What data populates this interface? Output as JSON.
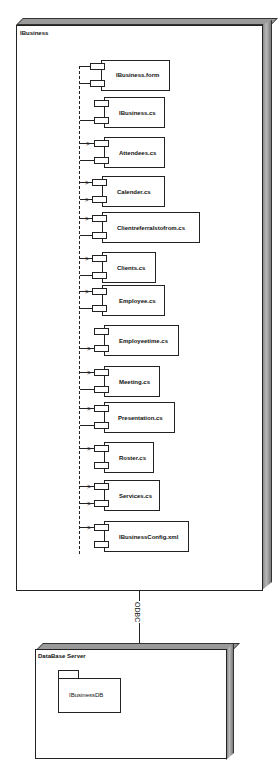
{
  "diagram": {
    "type": "UML deployment diagram",
    "nodes": [
      {
        "name": "IBusiness",
        "components": [
          {
            "label": "IBusiness.form"
          },
          {
            "label": "IBusiness.cs"
          },
          {
            "label": "Attendees.cs"
          },
          {
            "label": "Calender.cs"
          },
          {
            "label": "Clientreferralstofrom.cs"
          },
          {
            "label": "Clients.cs"
          },
          {
            "label": "Employee.cs"
          },
          {
            "label": "Employeetime.cs"
          },
          {
            "label": "Meeting.cs"
          },
          {
            "label": "Presentation.cs"
          },
          {
            "label": "Roster.cs"
          },
          {
            "label": "Services.cs"
          },
          {
            "label": "IBusinessConfig.xml"
          }
        ]
      },
      {
        "name": "DataBase Server",
        "packages": [
          {
            "label": "IBusinessDB"
          }
        ]
      }
    ],
    "connections": [
      {
        "from": "IBusiness",
        "to": "DataBase Server",
        "label": "ODBC"
      }
    ]
  },
  "colors": {
    "line": "#222222",
    "node_shade": "#9a9a9a",
    "background": "#ffffff"
  }
}
